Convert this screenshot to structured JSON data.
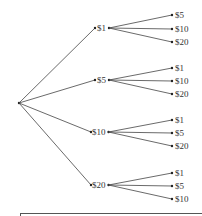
{
  "diagram": {
    "type": "tree",
    "root": {
      "x": 19,
      "y": 103
    },
    "branches": [
      {
        "label": "$1",
        "x": 95,
        "y": 28,
        "tx": 97,
        "children": [
          {
            "label": "$5",
            "y": 15
          },
          {
            "label": "$10",
            "y": 29
          },
          {
            "label": "$20",
            "y": 42
          }
        ]
      },
      {
        "label": "$5",
        "x": 95,
        "y": 80,
        "tx": 97,
        "children": [
          {
            "label": "$1",
            "y": 68
          },
          {
            "label": "$10",
            "y": 81
          },
          {
            "label": "$20",
            "y": 94
          }
        ]
      },
      {
        "label": "$10",
        "x": 91,
        "y": 132,
        "tx": 92,
        "children": [
          {
            "label": "$1",
            "y": 120
          },
          {
            "label": "$5",
            "y": 133
          },
          {
            "label": "$20",
            "y": 146
          }
        ]
      },
      {
        "label": "$20",
        "x": 91,
        "y": 185,
        "tx": 92,
        "children": [
          {
            "label": "$1",
            "y": 173
          },
          {
            "label": "$5",
            "y": 186
          },
          {
            "label": "$10",
            "y": 199
          }
        ]
      }
    ],
    "leaf_x": 172,
    "line_color": "#444444"
  }
}
